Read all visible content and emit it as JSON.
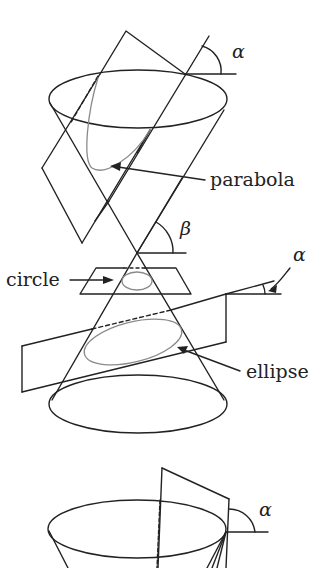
{
  "figure": {
    "colors": {
      "line": "#222222",
      "curve": "#8a8a8a",
      "background": "#ffffff"
    },
    "labels": {
      "parabola": "parabola",
      "circle": "circle",
      "ellipse": "ellipse",
      "alpha_top": "α",
      "beta": "β",
      "alpha_mid": "α",
      "alpha_bottom": "α"
    }
  }
}
